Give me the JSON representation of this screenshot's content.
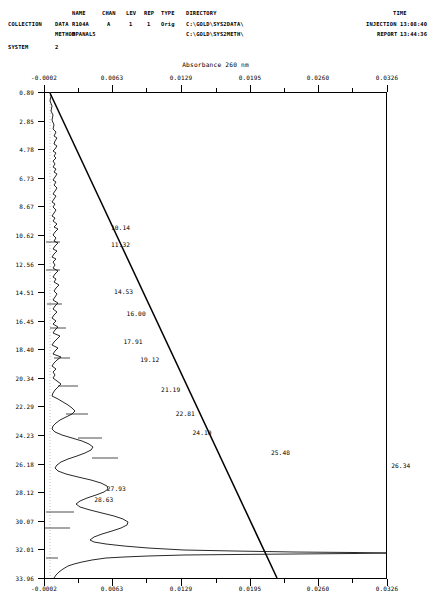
{
  "header": {
    "columns": {
      "name": "NAME",
      "chan": "CHAN",
      "lev": "LEV",
      "rep": "REP",
      "type": "TYPE",
      "directory": "DIRECTORY",
      "time": "TIME"
    },
    "collection_label": "COLLECTION",
    "data_label": "DATA",
    "method_label": "METHOD",
    "system_label": "SYSTEM",
    "data_name": "R104A",
    "method_name": "MPANAL5",
    "chan": "A",
    "lev": "1",
    "rep": "1",
    "type": "Orig",
    "data_directory": "C:\\GOLD\\SYS2DATA\\",
    "method_directory": "C:\\GOLD\\SYS2METH\\",
    "system_value": "2",
    "injection_label": "INJECTION",
    "injection_time": "13:08:40",
    "report_label": "REPORT",
    "report_time": "13:44:36"
  },
  "chart_data": {
    "type": "line",
    "title": "Absorbance 260 nm",
    "xlabel": "Absorbance 260 nm",
    "ylabel": "Time (min)",
    "xlim": [
      -0.0002,
      0.0326
    ],
    "ylim": [
      0.89,
      33.96
    ],
    "grid": false,
    "legend": "none",
    "x_ticks": [
      "-0.0002",
      "0.0063",
      "0.0129",
      "0.0195",
      "0.0260",
      "0.0326"
    ],
    "x_tick_values": [
      -0.0002,
      0.0063,
      0.0129,
      0.0195,
      0.026,
      0.0326
    ],
    "y_ticks": [
      "0.89",
      "2.85",
      "4.78",
      "6.73",
      "8.67",
      "10.62",
      "12.56",
      "14.51",
      "16.45",
      "18.40",
      "20.34",
      "22.29",
      "24.23",
      "26.18",
      "28.12",
      "30.07",
      "32.01",
      "33.96"
    ],
    "y_tick_values": [
      0.89,
      2.85,
      4.78,
      6.73,
      8.67,
      10.62,
      12.56,
      14.51,
      16.45,
      18.4,
      20.34,
      22.29,
      24.23,
      26.18,
      28.12,
      30.07,
      32.01,
      33.96
    ],
    "peak_labels": [
      {
        "label": "10.14",
        "x": 0.0062,
        "y": 10.14
      },
      {
        "label": "11.32",
        "x": 0.0062,
        "y": 11.32
      },
      {
        "label": "14.53",
        "x": 0.0065,
        "y": 14.53
      },
      {
        "label": "16.00",
        "x": 0.0077,
        "y": 16.0
      },
      {
        "label": "17.91",
        "x": 0.0074,
        "y": 17.91
      },
      {
        "label": "19.12",
        "x": 0.009,
        "y": 19.12
      },
      {
        "label": "21.19",
        "x": 0.011,
        "y": 21.19
      },
      {
        "label": "22.81",
        "x": 0.0124,
        "y": 22.81
      },
      {
        "label": "24.10",
        "x": 0.014,
        "y": 24.1
      },
      {
        "label": "25.48",
        "x": 0.0215,
        "y": 25.48
      },
      {
        "label": "26.34",
        "x": 0.033,
        "y": 26.34
      },
      {
        "label": "27.93",
        "x": 0.0058,
        "y": 27.93
      },
      {
        "label": "28.63",
        "x": 0.0046,
        "y": 28.63
      }
    ],
    "series": [
      {
        "name": "absorbance-trace",
        "description": "Chromatogram trace, absorbance versus elution time"
      },
      {
        "name": "gradient-line",
        "description": "Straight gradient/baseline overlay from upper-left to lower-right"
      }
    ]
  }
}
